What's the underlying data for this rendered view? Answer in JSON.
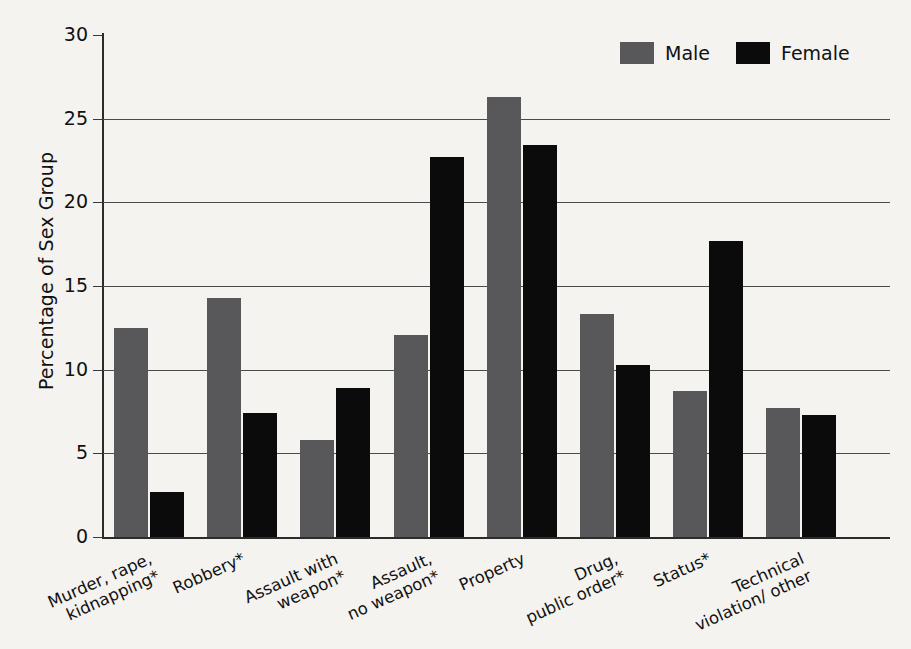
{
  "chart_data": {
    "type": "bar",
    "title": "",
    "xlabel": "",
    "ylabel": "Percentage of Sex Group",
    "ylim": [
      0,
      30
    ],
    "ytick_values": [
      0,
      5,
      10,
      15,
      20,
      25,
      30
    ],
    "ytick_labels": [
      "0",
      "5",
      "10",
      "15",
      "20",
      "25",
      "30"
    ],
    "grid": "horizontal",
    "legend_position": "top-right",
    "categories": [
      "Murder, rape,\nkidnapping*",
      "Robbery*",
      "Assault with\nweapon*",
      "Assault,\nno weapon*",
      "Property",
      "Drug,\npublic order*",
      "Status*",
      "Technical\nviolation/ other"
    ],
    "series": [
      {
        "name": "Male",
        "color": "#58585a",
        "values": [
          12.5,
          14.3,
          5.8,
          12.1,
          26.3,
          13.3,
          8.7,
          7.7
        ]
      },
      {
        "name": "Female",
        "color": "#0b0b0b",
        "values": [
          2.7,
          7.4,
          8.9,
          22.7,
          23.4,
          10.3,
          17.7,
          7.3
        ]
      }
    ]
  },
  "axis": {
    "y_title": "Percentage of Sex Group"
  },
  "legend": {
    "entries": [
      {
        "label": "Male",
        "swatch": "male-swatch"
      },
      {
        "label": "Female",
        "swatch": "female-swatch"
      }
    ]
  }
}
